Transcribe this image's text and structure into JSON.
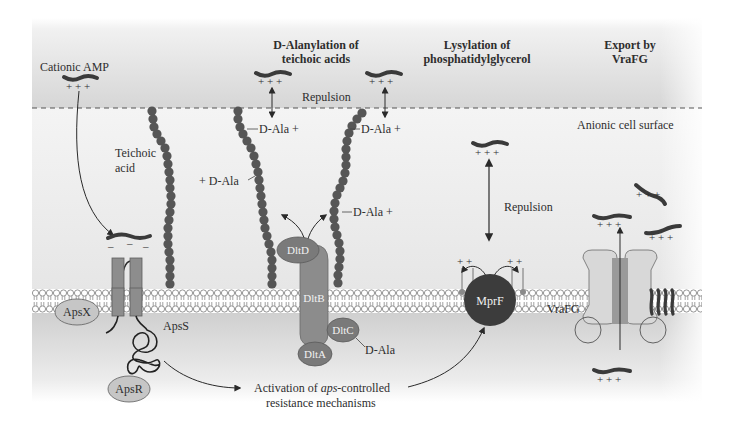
{
  "headers": {
    "dalanylation_line1": "D-Alanylation of",
    "dalanylation_line2": "teichoic acids",
    "lysylation_line1": "Lysylation of",
    "lysylation_line2": "phosphatidylglycerol",
    "export_line1": "Export by",
    "export_line2": "VraFG"
  },
  "labels": {
    "cationic_amp": "Cationic AMP",
    "repulsion_top": "Repulsion",
    "anionic_surface": "Anionic cell surface",
    "teichoic_line1": "Teichoic",
    "teichoic_line2": "acid",
    "dala_1": "D-Ala +",
    "dala_2": "D-Ala +",
    "dala_3": "+ D-Ala",
    "dala_4": "D-Ala +",
    "dala_free": "D-Ala",
    "repulsion_mprf": "Repulsion",
    "vrafg": "VraFG",
    "apsS": "ApsS",
    "activation_prefix": "Activation of ",
    "activation_italic": "aps",
    "activation_suffix": "-controlled",
    "activation_line2": "resistance mechanisms"
  },
  "proteins": {
    "dltD": "DltD",
    "dltB": "DltB",
    "dltC": "DltC",
    "dltA": "DltA",
    "mprF": "MprF",
    "apsX": "ApsX",
    "apsR": "ApsR"
  },
  "charges": {
    "plus3": "+ + +",
    "plus2": "+  +",
    "minus": "–"
  },
  "colors": {
    "bg_grey": "#d9d9d9",
    "membrane_bg": "#ffffff",
    "lipid_head": "#ffffff",
    "lipid_stroke": "#777777",
    "bead": "#555555",
    "peptide": "#3a3a3a",
    "protein_mid": "#8a8a8a",
    "protein_dark": "#3c3c3c",
    "protein_light": "#bdbdbd",
    "text": "#2e2e2e"
  }
}
